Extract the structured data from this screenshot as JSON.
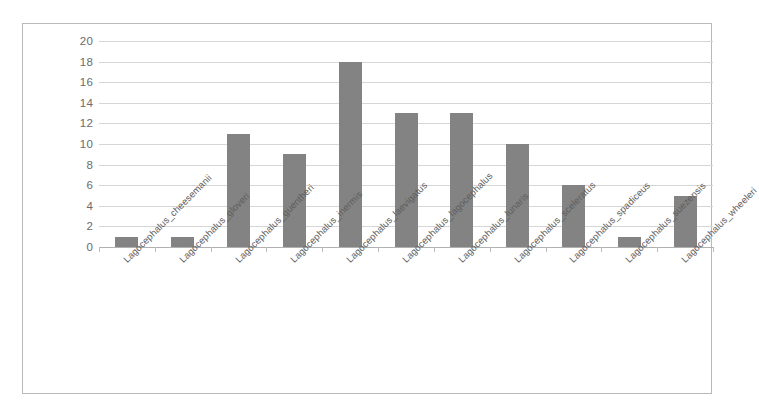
{
  "chart_data": {
    "type": "bar",
    "title": "",
    "subtitle": "",
    "xlabel": "",
    "ylabel": "",
    "ylim": [
      0,
      20
    ],
    "ytick_step": 2,
    "yticks": [
      20,
      18,
      16,
      14,
      12,
      10,
      8,
      6,
      4,
      2,
      0
    ],
    "grid": true,
    "legend": false,
    "legend_position": "none",
    "bar_color": "#838383",
    "gridline_color": "#d6d6d6",
    "border_color": "#b9b9b9",
    "categories": [
      "Lagocephalus_cheesemanii",
      "Lagocephalus_gloveri",
      "Lagocephalus_guentheri",
      "Lagocephalus_inermis",
      "Lagocephalus_laevigatus",
      "Lagocephalus_lagocephalus",
      "Lagocephalus_lunaris",
      "Lagocephalus_sceleratus",
      "Lagocephalus_spadiceus",
      "Lagocephalus_suezensis",
      "Lagocephalus_wheeleri"
    ],
    "values": [
      1,
      1,
      11,
      9,
      18,
      13,
      13,
      10,
      6,
      1,
      5
    ]
  }
}
